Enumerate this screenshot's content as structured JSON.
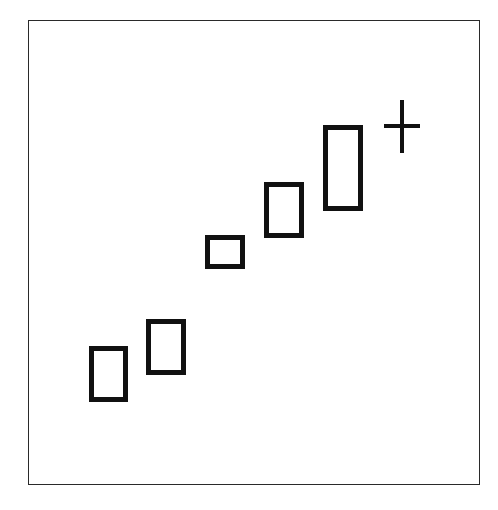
{
  "diagram": {
    "type": "candlestick-pattern",
    "frame": {
      "x": 28,
      "y": 20,
      "width": 452,
      "height": 465,
      "stroke": "#2a2a2a"
    },
    "stroke_color": "#111111",
    "body_fill": "#ffffff",
    "body_stroke_width": 5,
    "candles": [
      {
        "id": "candle-1",
        "kind": "hollow-body",
        "x": 89,
        "y": 346,
        "width": 39,
        "height": 56
      },
      {
        "id": "candle-2",
        "kind": "hollow-body",
        "x": 146,
        "y": 319,
        "width": 40,
        "height": 56
      },
      {
        "id": "candle-3",
        "kind": "hollow-body",
        "x": 205,
        "y": 235,
        "width": 40,
        "height": 34
      },
      {
        "id": "candle-4",
        "kind": "hollow-body",
        "x": 264,
        "y": 182,
        "width": 40,
        "height": 56
      },
      {
        "id": "candle-5",
        "kind": "hollow-body",
        "x": 323,
        "y": 125,
        "width": 40,
        "height": 86
      }
    ],
    "doji": {
      "id": "doji-cross",
      "kind": "doji",
      "cx": 402,
      "open_close_y": 126,
      "half_width": 18,
      "high_y": 100,
      "low_y": 153
    }
  },
  "chart_data": {
    "type": "candlestick",
    "title": "",
    "xlabel": "",
    "ylabel": "",
    "grid": false,
    "legend": null,
    "candles": [
      {
        "index": 1,
        "open": 2.0,
        "close": 3.3,
        "color": "hollow"
      },
      {
        "index": 2,
        "open": 2.6,
        "close": 3.9,
        "color": "hollow"
      },
      {
        "index": 3,
        "open": 5.0,
        "close": 5.8,
        "color": "hollow"
      },
      {
        "index": 4,
        "open": 5.6,
        "close": 6.9,
        "color": "hollow"
      },
      {
        "index": 5,
        "open": 6.5,
        "close": 8.5,
        "color": "hollow"
      },
      {
        "index": 6,
        "open": 8.5,
        "close": 8.5,
        "high": 9.1,
        "low": 7.9,
        "color": "doji"
      }
    ]
  }
}
